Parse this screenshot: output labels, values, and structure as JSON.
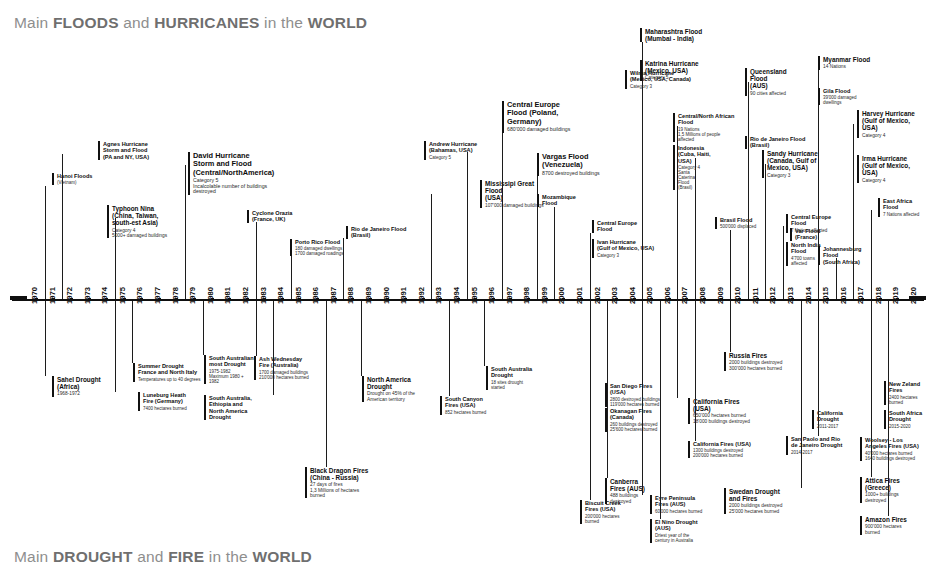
{
  "titles": {
    "top_pre": "Main ",
    "top_b1": "FLOODS",
    "top_mid": " and ",
    "top_b2": "HURRICANES",
    "top_post": " in the ",
    "top_b3": "WORLD",
    "bottom_pre": "Main ",
    "bottom_b1": "DROUGHT",
    "bottom_mid": " and ",
    "bottom_b2": "FIRE",
    "bottom_post": " in the ",
    "bottom_b3": "WORLD"
  },
  "axis": {
    "start_year": 1970,
    "end_year": 2020,
    "years": [
      "1970",
      "1971",
      "1972",
      "1973",
      "1974",
      "1975",
      "1976",
      "1977",
      "1978",
      "1979",
      "1980",
      "1981",
      "1982",
      "1983",
      "1984",
      "1985",
      "1986",
      "1987",
      "1988",
      "1989",
      "1990",
      "1991",
      "1992",
      "1993",
      "1994",
      "1995",
      "1996",
      "1997",
      "1998",
      "1999",
      "2000",
      "2001",
      "2002",
      "2003",
      "2004",
      "2005",
      "2006",
      "2007",
      "2008",
      "2009",
      "2010",
      "2011",
      "2012",
      "2013",
      "2014",
      "2015",
      "2016",
      "2017",
      "2018",
      "2019",
      "2020"
    ]
  },
  "colors": {
    "axis": "#0f0f0f",
    "title": "#8e8e8e",
    "title_bold": "#6f6f6f",
    "text": "#0d0d0d"
  },
  "floods": [
    {
      "id": "hanoi",
      "title": "Hanoi  Floods",
      "sub": "(Vietnam)",
      "year": 1971
    },
    {
      "id": "agnes",
      "title": "Agnes Hurricane\nStorm and Flood\n(PA and NY, USA)",
      "sub": "",
      "year": 1972
    },
    {
      "id": "nina",
      "title": "Typhoon Nina\n(China, Taiwan,\nsouth-est Asia)",
      "sub": "Category 4\n5000+ damaged buildings",
      "year": 1975
    },
    {
      "id": "david",
      "title": "David Hurricane\nStorm and Flood\n(Central/NorthAmerica)",
      "sub": "Category 5\nIncalcolable number of buildings\ndestroyed",
      "year": 1979
    },
    {
      "id": "cyclone-orazia",
      "title": "Cyclone Orazia\n(France, UK)",
      "sub": "",
      "year": 1983
    },
    {
      "id": "porto-rico",
      "title": "Porto Rico Flood",
      "sub": "180 damaged dwellings\n1700 damaged roadings",
      "year": 1985
    },
    {
      "id": "rio-1988",
      "title": "Rio de Janeiro Flood\n(Brasil)",
      "sub": "",
      "year": 1988
    },
    {
      "id": "mississipi",
      "title": "Mississipi Great\nFlood\n(USA)",
      "sub": "107'000 damaged buildings",
      "year": 1993
    },
    {
      "id": "central-europe-97",
      "title": "Central Europe\nFlood (Poland,\nGermany)",
      "sub": "680'000 damaged buildings",
      "year": 1997
    },
    {
      "id": "andrew",
      "title": "Andrew Hurricane\n(Bahamas, USA)",
      "sub": "Category 5",
      "year": 1995
    },
    {
      "id": "vargas",
      "title": "Vargas Flood\n(Venezuela)",
      "sub": "8700 destroyed buildings",
      "year": 1999
    },
    {
      "id": "mozambique",
      "title": "Mozambique\nFlood",
      "sub": "",
      "year": 2000
    },
    {
      "id": "central-europe-02",
      "title": "Central Europe\nFlood",
      "sub": "",
      "year": 2002
    },
    {
      "id": "maharashtra",
      "title": "Maharashtra Flood\n(Mumbai - India)",
      "sub": "",
      "year": 2005
    },
    {
      "id": "katrina",
      "title": "Katrina Hurricane\n(Mexico, USA)",
      "sub": "Category 5",
      "year": 2005
    },
    {
      "id": "wilma",
      "title": "Wilma Hurricane\n(Mexico, USA, Canada)",
      "sub": "Category 3",
      "year": 2005
    },
    {
      "id": "central-north-africa",
      "title": "Central/North African\nFlood",
      "sub": "19 Nations\n1,5 Millions of people\naffected",
      "year": 2007
    },
    {
      "id": "ivan",
      "title": "Ivan Hurricane\n(Gulf of Mexico, USA)",
      "sub": "Category 3",
      "year": 2007
    },
    {
      "id": "indonesia-haiti",
      "title": "Indonesia\n(Cuba, Haiti,\nUSA)",
      "sub": "Category 4\nSanta\nCaterina\nFlood\n(Brasil)",
      "year": 2008
    },
    {
      "id": "brasil-flood",
      "title": "Brasil Flood",
      "sub": "500'000 displaced",
      "year": 2010
    },
    {
      "id": "queensland",
      "title": "Queensland\nFlood\n(AUS)",
      "sub": "90 cities affected",
      "year": 2011
    },
    {
      "id": "rio-2011",
      "title": "Rio de Janeiro Flood\n(Brasil)",
      "sub": "",
      "year": 2011
    },
    {
      "id": "sandy",
      "title": "Sandy Hurricane\n(Canada, Gulf of\nMexico, USA)",
      "sub": "Category 3",
      "year": 2012
    },
    {
      "id": "var",
      "title": "Var Flood\n(France)",
      "sub": "",
      "year": 2013
    },
    {
      "id": "central-europe-13",
      "title": "Central Europe\nFlood",
      "sub": "7 Nations affected",
      "year": 2013
    },
    {
      "id": "north-india",
      "title": "North India\nFlood",
      "sub": "4'700 towns\naffected",
      "year": 2013
    },
    {
      "id": "myanmar",
      "title": "Myanmar Flood",
      "sub": "14 Nations",
      "year": 2015
    },
    {
      "id": "gila",
      "title": "Gila Flood",
      "sub": "39'000 damaged\ndwellings",
      "year": 2015
    },
    {
      "id": "johannesburg",
      "title": "Johannesburg\nFlood\n(South Africa)",
      "sub": "",
      "year": 2016
    },
    {
      "id": "harvey",
      "title": "Harvey  Hurricane\n(Gulf of Mexico,\nUSA)",
      "sub": "Category 4",
      "year": 2017
    },
    {
      "id": "irma",
      "title": "Irma Hurricane\n(Gulf of Mexico,\nUSA)",
      "sub": "Category 4",
      "year": 2017
    },
    {
      "id": "east-africa",
      "title": "East Africa\nFlood",
      "sub": "7 Nations affected",
      "year": 2018
    }
  ],
  "droughts": [
    {
      "id": "sahel",
      "title": "Sahel Drought\n(Africa)",
      "sub": "1968-1972",
      "year": 1971
    },
    {
      "id": "luneburg",
      "title": "Luneburg Heath\nFire (Germany)",
      "sub": "7400 hectares burned",
      "year": 1975
    },
    {
      "id": "summer-drought",
      "title": "Summer Drought\nFrance and North Italy",
      "sub": "Temperatures up to 40 degrees",
      "year": 1976
    },
    {
      "id": "south-australian",
      "title": "South Australian\nmost Drought",
      "sub": "1975-1982\nMaximum 1980 +\n1982",
      "year": 1980
    },
    {
      "id": "ash-wednesday",
      "title": "Ash Wednesday\nFire (Australia)",
      "sub": "1700 damaged buildings\n210'000 hectares burned",
      "year": 1983
    },
    {
      "id": "sa-ethiopia-na",
      "title": "South Australia,\nEthiopia and\nNorth America\nDrought",
      "sub": "",
      "year": 1984
    },
    {
      "id": "north-america-drought",
      "title": "North America\nDrought",
      "sub": "Drought on 45% of the\nAmerican territory",
      "year": 1989
    },
    {
      "id": "black-dragon",
      "title": "Black Dragon Fires\n(China - Russia)",
      "sub": "27 days of fires\n1,3 Millions of hectares\nburned",
      "year": 1987
    },
    {
      "id": "south-canyon",
      "title": "South Canyon\nFires (USA)",
      "sub": "852 hectares burned",
      "year": 1994
    },
    {
      "id": "south-australia-drought",
      "title": "South Australia\nDrought",
      "sub": "18 sites drought started",
      "year": 1996
    },
    {
      "id": "san-diego",
      "title": "San Diego Fires\n(USA)",
      "sub": "2800 destroyed buildings\n119'000 hectares burned",
      "year": 2003
    },
    {
      "id": "okanagan",
      "title": "Okanagan Fires\n(Canada)",
      "sub": "260 buildings destroyed\n25'600 hectares burned",
      "year": 2003
    },
    {
      "id": "canberra",
      "title": "Canberra\nFires (AUS)",
      "sub": "488 buildings\ndestroyed",
      "year": 2003
    },
    {
      "id": "biscuit",
      "title": "Biscuit Creek\nFires (USA)",
      "sub": "200'000 hectares\nburned",
      "year": 2002
    },
    {
      "id": "eyre",
      "title": "Eyre Peninsula\nFires (AUS)",
      "sub": "60'000 hectares burned",
      "year": 2005
    },
    {
      "id": "el-nino",
      "title": "El Nino Drought\n(AUS)",
      "sub": "Driest year of the\ncentury in Australia",
      "year": 2006
    },
    {
      "id": "california-fires",
      "title": "California Fires\n(USA)",
      "sub": "650'000 hectares burned\n18'000 buildings destroyed",
      "year": 2007
    },
    {
      "id": "california-fires-2",
      "title": "California Fires (USA)",
      "sub": "1300 buildings destroyed\n200'000 hectares burned",
      "year": 2008
    },
    {
      "id": "russia-fires",
      "title": "Russia Fires",
      "sub": "2000 buildings destroyed\n300'000 hectares burned",
      "year": 2010
    },
    {
      "id": "swedan",
      "title": "Swedan Drought\nand Fires",
      "sub": "2000 buildings destroyed\n25'000 hectares burned",
      "year": 2014
    },
    {
      "id": "california-drought",
      "title": "California\nDrought",
      "sub": "2011-2017",
      "year": 2015
    },
    {
      "id": "san-paolo",
      "title": "San Paolo and Rio\nde Janeiro Drought",
      "sub": "2014-2017",
      "year": 2015
    },
    {
      "id": "new-zeland",
      "title": "New Zeland\nFires",
      "sub": "2400 hectares\nburned",
      "year": 2019
    },
    {
      "id": "south-africa-drought",
      "title": "South Africa\nDrought",
      "sub": "2015-2020",
      "year": 2019
    },
    {
      "id": "woolsey",
      "title": "Woolsey - Los\nAngeles Fires (USA)",
      "sub": "40'000 hectares burned\n1640 buildings destroyed",
      "year": 2018
    },
    {
      "id": "attica",
      "title": "Attica  Fires\n(Greece)",
      "sub": "1000+ buildings\ndestroyed",
      "year": 2018
    },
    {
      "id": "amazon",
      "title": "Amazon Fires",
      "sub": "900'000 hectares\nburned",
      "year": 2019
    }
  ]
}
